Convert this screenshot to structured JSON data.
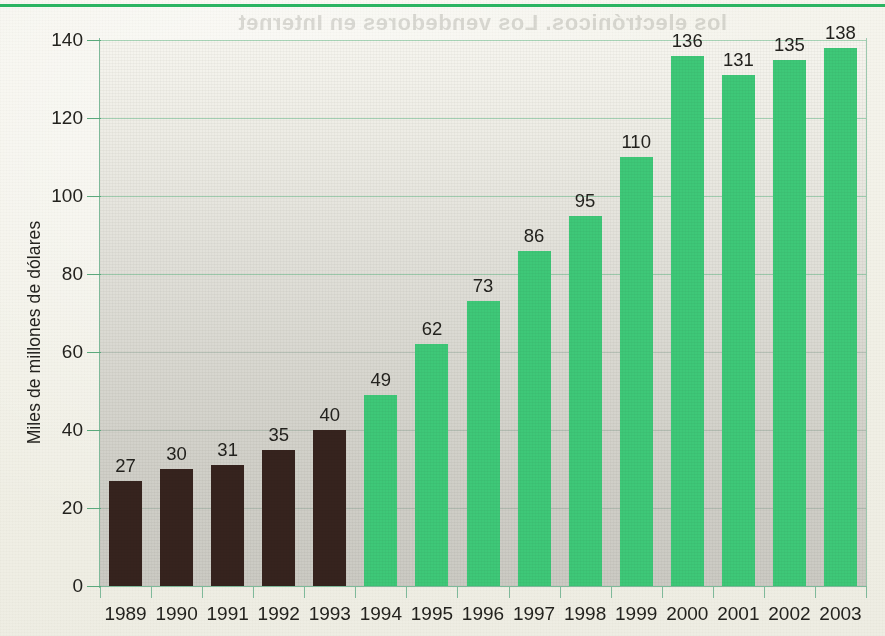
{
  "chart_data": {
    "type": "bar",
    "title": "",
    "xlabel": "",
    "ylabel": "Miles de millones de dólares",
    "ylim": [
      0,
      140
    ],
    "yticks": [
      0,
      20,
      40,
      60,
      80,
      100,
      120,
      140
    ],
    "grid": true,
    "legend": "none",
    "categories": [
      "1989",
      "1990",
      "1991",
      "1992",
      "1993",
      "1994",
      "1995",
      "1996",
      "1997",
      "1998",
      "1999",
      "2000",
      "2001",
      "2002",
      "2003"
    ],
    "values": [
      27,
      30,
      31,
      35,
      40,
      49,
      62,
      73,
      86,
      95,
      110,
      136,
      131,
      135,
      138
    ],
    "bar_colors": [
      "dark",
      "dark",
      "dark",
      "dark",
      "dark",
      "green",
      "green",
      "green",
      "green",
      "green",
      "green",
      "green",
      "green",
      "green",
      "green"
    ],
    "colors": {
      "dark_bar": "#36231e",
      "green_bar": "#3ec878",
      "gridline": "#48aa70",
      "axis": "#7fb99a",
      "text": "#23221e",
      "page_background": "#f3f2ea",
      "plot_background_top": "#f6f5ef",
      "plot_background_bottom": "#cbcac3",
      "top_rule": "#2bb462"
    }
  },
  "axes": {
    "y_title": "Miles de millones de dólares",
    "y_tick_labels": [
      "140",
      "120",
      "100",
      "80",
      "60",
      "40",
      "20",
      "0"
    ],
    "x_tick_labels": [
      "1989",
      "1990",
      "1991",
      "1992",
      "1993",
      "1994",
      "1995",
      "1996",
      "1997",
      "1998",
      "1999",
      "2000",
      "2001",
      "2002",
      "2003"
    ]
  },
  "bar_labels": [
    "27",
    "30",
    "31",
    "35",
    "40",
    "49",
    "62",
    "73",
    "86",
    "95",
    "110",
    "136",
    "131",
    "135",
    "138"
  ],
  "bleed_through": {
    "line1": "los electrónicos. Los vendedores en Internet",
    "line2": "han tenido un aumento del volumen que",
    "line3": "convierte en sustituto otro comercio.",
    "line4": "Comercio por Internet, 1989-2003"
  }
}
